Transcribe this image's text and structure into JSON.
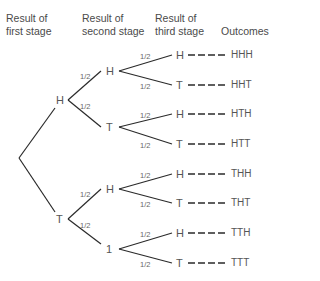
{
  "headers": {
    "first": "Result of\nfirst stage",
    "second": "Result of\nsecond stage",
    "third": "Result of\nthird stage",
    "outcomes": "Outcomes"
  },
  "stage1": [
    "H",
    "T"
  ],
  "stage2": [
    "H",
    "T",
    "H",
    "1"
  ],
  "stage3": [
    "H",
    "T",
    "H",
    "T",
    "H",
    "T",
    "H",
    "T"
  ],
  "outcomes": [
    "HHH",
    "HHT",
    "HTH",
    "HTT",
    "THH",
    "THT",
    "TTH",
    "TTT"
  ],
  "prob": "1/2",
  "colors": {
    "line": "#2a2a2a",
    "text": "#555555"
  }
}
